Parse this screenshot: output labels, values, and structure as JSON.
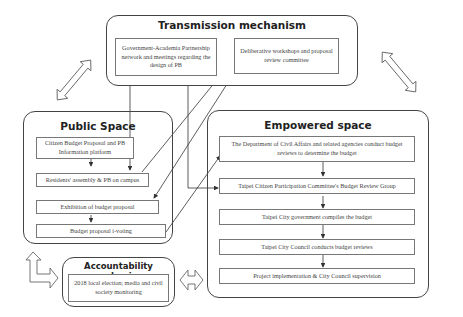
{
  "diagram": {
    "groups": {
      "transmission": {
        "title": "Transmission mechanism",
        "boxes": [
          "Government-Academia Partnership network and meetings regarding the design of PB",
          "Deliberative workshops and proposal review committee"
        ]
      },
      "public_space": {
        "title": "Public Space",
        "boxes": [
          "Citizen Budget Proposal and PB Information platform",
          "Residents' assembly & PB on campus",
          "Exhibition of budget proposal",
          "Budget proposal i-voting"
        ]
      },
      "empowered_space": {
        "title": "Empowered space",
        "boxes": [
          "The Department of Civil Affairs and related agencies conduct budget reviews to determine the budget",
          "Taipei Citizen Participation Committee's Budget Review Group",
          "Taipei City government compiles the budget",
          "Taipei City Council conducts budget reviews",
          "Project implementation & City Council supervision"
        ]
      },
      "accountability": {
        "title": "Accountability mechanism",
        "boxes": [
          "2018 local election; media and civil society monitoring"
        ]
      }
    },
    "connections": [
      {
        "from": "Government-Academia Partnership network",
        "to": "Residents' assembly & PB on campus"
      },
      {
        "from": "Government-Academia Partnership network",
        "to": "Taipei Citizen Participation Committee's Budget Review Group"
      },
      {
        "from": "Residents' assembly & PB on campus",
        "to": "Deliberative workshops and proposal review committee"
      },
      {
        "from": "Deliberative workshops and proposal review committee",
        "to": "Exhibition of budget proposal"
      },
      {
        "from": "Budget proposal i-voting",
        "to": "The Department of Civil Affairs and related agencies"
      },
      {
        "from": "Citizen Budget Proposal and PB Information platform",
        "to": "Residents' assembly & PB on campus"
      },
      {
        "from": "Exhibition of budget proposal",
        "to": "Budget proposal i-voting"
      }
    ],
    "colors": {
      "border": "#444444",
      "box_border": "#777777",
      "text": "#444444",
      "title": "#222222"
    }
  }
}
